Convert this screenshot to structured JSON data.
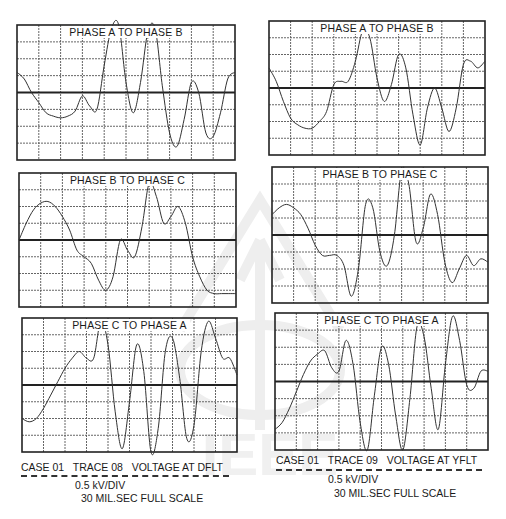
{
  "figure": {
    "left_column": {
      "caption": "CASE 01   TRACE 08   VOLTAGE AT DFLT",
      "scale_line1": "0.5 kV/DIV",
      "scale_line2": "30 MIL.SEC FULL SCALE"
    },
    "right_column": {
      "caption": "CASE 01   TRACE 09   VOLTAGE AT YFLT",
      "scale_line1": "0.5 kV/DIV",
      "scale_line2": "30 MIL.SEC FULL SCALE"
    },
    "watermark": "IEEE"
  },
  "chart_data": [
    {
      "type": "line",
      "title": "PHASE A TO PHASE B",
      "trace": "TRACE 08 — VOLTAGE AT DFLT",
      "xlabel": "Time (ms)",
      "ylabel": "Voltage (kV)",
      "xlim": [
        0,
        30
      ],
      "ylim": [
        -2,
        2
      ],
      "grid": true,
      "x_divisions": 10,
      "y_divisions": 8,
      "x": [
        0,
        1,
        2,
        3,
        4,
        5,
        6,
        7,
        8,
        9,
        10,
        11,
        12,
        13,
        14,
        15,
        16,
        17,
        18,
        19,
        20,
        21,
        22,
        23,
        24,
        25,
        26,
        27,
        28,
        29,
        30
      ],
      "values": [
        0.6,
        0.4,
        0.0,
        -0.3,
        -0.6,
        -0.7,
        -0.75,
        -0.7,
        -0.55,
        -0.1,
        -0.4,
        -0.5,
        0.8,
        1.9,
        2.0,
        0.3,
        -0.6,
        0.3,
        1.8,
        1.9,
        0.2,
        -1.2,
        -1.6,
        -0.8,
        0.3,
        0.0,
        -1.2,
        -1.3,
        -0.6,
        0.4,
        0.6
      ]
    },
    {
      "type": "line",
      "title": "PHASE B TO PHASE C",
      "trace": "TRACE 08 — VOLTAGE AT DFLT",
      "xlabel": "Time (ms)",
      "ylabel": "Voltage (kV)",
      "xlim": [
        0,
        30
      ],
      "ylim": [
        -2,
        2
      ],
      "grid": true,
      "x_divisions": 10,
      "y_divisions": 8,
      "x": [
        0,
        1,
        2,
        3,
        4,
        5,
        6,
        7,
        8,
        9,
        10,
        11,
        12,
        13,
        14,
        15,
        16,
        17,
        18,
        19,
        20,
        21,
        22,
        23,
        24,
        25,
        26,
        27,
        28,
        29,
        30
      ],
      "values": [
        0.0,
        0.5,
        0.9,
        1.1,
        1.15,
        1.0,
        0.7,
        0.3,
        -0.3,
        -0.5,
        -0.7,
        -1.2,
        -1.5,
        -1.1,
        0.0,
        -0.3,
        -0.5,
        0.4,
        1.7,
        1.3,
        0.5,
        0.7,
        1.0,
        0.5,
        -0.5,
        -1.1,
        -1.5,
        -1.6,
        -1.6,
        -1.6,
        -1.6
      ]
    },
    {
      "type": "line",
      "title": "PHASE C TO PHASE A",
      "trace": "TRACE 08 — VOLTAGE AT DFLT",
      "xlabel": "Time (ms)",
      "ylabel": "Voltage (kV)",
      "xlim": [
        0,
        30
      ],
      "ylim": [
        -2,
        2
      ],
      "grid": true,
      "x_divisions": 10,
      "y_divisions": 8,
      "x": [
        0,
        1,
        2,
        3,
        4,
        5,
        6,
        7,
        8,
        9,
        10,
        11,
        12,
        13,
        14,
        15,
        16,
        17,
        18,
        19,
        20,
        21,
        22,
        23,
        24,
        25,
        26,
        27,
        28,
        29,
        30
      ],
      "values": [
        -1.0,
        -1.1,
        -1.0,
        -0.7,
        -0.3,
        0.1,
        0.5,
        0.8,
        1.0,
        0.8,
        0.8,
        1.9,
        1.2,
        -0.8,
        -1.9,
        -0.5,
        1.2,
        0.4,
        -2.0,
        -1.3,
        1.0,
        1.4,
        0.2,
        -1.6,
        -1.2,
        1.0,
        1.9,
        1.4,
        0.8,
        0.8,
        0.3
      ]
    },
    {
      "type": "line",
      "title": "PHASE A TO PHASE B",
      "trace": "TRACE 09 — VOLTAGE AT YFLT",
      "xlabel": "Time (ms)",
      "ylabel": "Voltage (kV)",
      "xlim": [
        0,
        30
      ],
      "ylim": [
        -2,
        2
      ],
      "grid": true,
      "x_divisions": 10,
      "y_divisions": 8,
      "x": [
        0,
        1,
        2,
        3,
        4,
        5,
        6,
        7,
        8,
        9,
        10,
        11,
        12,
        13,
        14,
        15,
        16,
        17,
        18,
        19,
        20,
        21,
        22,
        23,
        24,
        25,
        26,
        27,
        28,
        29,
        30
      ],
      "values": [
        0.6,
        0.2,
        -0.4,
        -0.9,
        -1.1,
        -1.2,
        -1.2,
        -1.0,
        -0.7,
        0.1,
        0.2,
        0.2,
        0.8,
        1.7,
        1.5,
        0.3,
        -0.4,
        0.1,
        1.0,
        0.6,
        -0.8,
        -1.7,
        -0.6,
        0.0,
        -0.6,
        -1.3,
        -0.6,
        0.7,
        0.8,
        0.6,
        0.8
      ]
    },
    {
      "type": "line",
      "title": "PHASE B TO PHASE C",
      "trace": "TRACE 09 — VOLTAGE AT YFLT",
      "xlabel": "Time (ms)",
      "ylabel": "Voltage (kV)",
      "xlim": [
        0,
        30
      ],
      "ylim": [
        -2,
        2
      ],
      "grid": true,
      "x_divisions": 10,
      "y_divisions": 8,
      "x": [
        0,
        1,
        2,
        3,
        4,
        5,
        6,
        7,
        8,
        9,
        10,
        11,
        12,
        13,
        14,
        15,
        16,
        17,
        18,
        19,
        20,
        21,
        22,
        23,
        24,
        25,
        26,
        27,
        28,
        29,
        30
      ],
      "values": [
        0.6,
        0.8,
        0.9,
        0.8,
        0.6,
        0.2,
        -0.3,
        -0.6,
        -0.6,
        -0.6,
        -0.9,
        -1.8,
        -1.0,
        0.9,
        0.8,
        -0.5,
        -0.9,
        0.0,
        1.9,
        1.5,
        -0.2,
        0.2,
        1.2,
        0.6,
        -0.8,
        -1.4,
        -1.0,
        -0.6,
        -0.9,
        -0.7,
        -0.8
      ]
    },
    {
      "type": "line",
      "title": "PHASE C TO PHASE A",
      "trace": "TRACE 09 — VOLTAGE AT YFLT",
      "xlabel": "Time (ms)",
      "ylabel": "Voltage (kV)",
      "xlim": [
        0,
        30
      ],
      "ylim": [
        -2,
        2
      ],
      "grid": true,
      "x_divisions": 10,
      "y_divisions": 8,
      "x": [
        0,
        1,
        2,
        3,
        4,
        5,
        6,
        7,
        8,
        9,
        10,
        11,
        12,
        13,
        14,
        15,
        16,
        17,
        18,
        19,
        20,
        21,
        22,
        23,
        24,
        25,
        26,
        27,
        28,
        29,
        30
      ],
      "values": [
        -1.4,
        -1.2,
        -0.8,
        -0.3,
        0.2,
        0.6,
        0.8,
        0.9,
        0.4,
        0.3,
        1.2,
        0.5,
        -1.2,
        -2.0,
        -0.4,
        1.0,
        0.5,
        -1.0,
        -2.2,
        -0.5,
        1.6,
        1.3,
        -0.2,
        -1.4,
        0.5,
        1.9,
        1.2,
        -0.1,
        -0.2,
        0.3,
        0.3
      ]
    }
  ]
}
